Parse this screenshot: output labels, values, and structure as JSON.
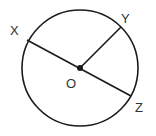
{
  "diagram": {
    "type": "circle-geometry",
    "circle": {
      "cx": 80,
      "cy": 68,
      "r": 58
    },
    "center": {
      "label": "O",
      "x": 80,
      "y": 68
    },
    "points": [
      {
        "label": "X",
        "x": 27,
        "y": 40
      },
      {
        "label": "Y",
        "x": 121,
        "y": 27
      },
      {
        "label": "Z",
        "x": 131,
        "y": 96
      }
    ],
    "segments": [
      {
        "from": "X",
        "to": "Z",
        "kind": "diameter"
      },
      {
        "from": "O",
        "to": "Y",
        "kind": "radius"
      }
    ],
    "stroke_color": "#1a1a1a"
  }
}
